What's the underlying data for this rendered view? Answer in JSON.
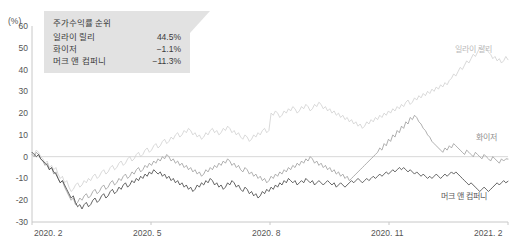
{
  "figure": {
    "clipped_header": "",
    "unit_label": "(%)"
  },
  "callout": {
    "title": "주가수익률 순위",
    "rows": [
      {
        "name": "일라이 릴리",
        "value": "44.5%"
      },
      {
        "name": "화이저",
        "value": "−1.1%"
      },
      {
        "name": "머크 앤 컴퍼니",
        "value": "−11.3%"
      }
    ]
  },
  "series_tags": {
    "lilly": "일라이 릴리",
    "pfizer": "화이저",
    "merck": "머크 앤 컴퍼니"
  },
  "colors": {
    "lilly": "#cfcfcf",
    "pfizer": "#9a9a9a",
    "merck": "#3c3c3c",
    "axis": "#c8c8c8",
    "zero_line": "#d8d8d8",
    "callout_bg": "#e2e2e2"
  },
  "chart_data": {
    "type": "line",
    "title": "주가수익률 순위",
    "xlabel": "",
    "ylabel": "(%)",
    "ylim": [
      -30,
      60
    ],
    "ytick_values": [
      60,
      50,
      40,
      30,
      20,
      10,
      0,
      -10,
      -20,
      -30
    ],
    "ytick_labels": [
      "60",
      "50",
      "40",
      "30",
      "20",
      "10",
      "0",
      "-10",
      "-20",
      "-30"
    ],
    "xtick_labels": [
      "2020. 2",
      "2020. 5",
      "2020. 8",
      "2020. 11",
      "2021. 2"
    ],
    "xtick_positions": [
      0,
      0.25,
      0.5,
      0.75,
      1.0
    ],
    "grid": false,
    "zero_line": true,
    "legend_position": "inline-right",
    "x_range": [
      "2020. 2",
      "2021. 2"
    ],
    "series": [
      {
        "name": "일라이 릴리",
        "color": "#cfcfcf",
        "final_value": 44.5,
        "values": [
          2,
          1,
          3,
          2,
          0,
          -1,
          -3,
          -2,
          -5,
          -4,
          -6,
          -5,
          -8,
          -10,
          -9,
          -12,
          -11,
          -14,
          -16,
          -15,
          -13,
          -12,
          -14,
          -13,
          -11,
          -12,
          -10,
          -11,
          -9,
          -8,
          -10,
          -9,
          -7,
          -6,
          -8,
          -7,
          -5,
          -4,
          -6,
          -5,
          -3,
          -2,
          -4,
          -3,
          -1,
          0,
          -2,
          -1,
          1,
          2,
          0,
          1,
          3,
          4,
          2,
          3,
          5,
          6,
          4,
          5,
          7,
          8,
          6,
          7,
          9,
          8,
          10,
          11,
          9,
          10,
          12,
          11,
          13,
          12,
          10,
          11,
          9,
          10,
          8,
          9,
          11,
          10,
          12,
          13,
          11,
          12,
          10,
          11,
          13,
          12,
          14,
          13,
          11,
          12,
          10,
          11,
          9,
          8,
          10,
          9,
          7,
          8,
          10,
          9,
          11,
          10,
          12,
          13,
          11,
          12,
          20,
          19,
          21,
          20,
          18,
          19,
          21,
          20,
          22,
          21,
          23,
          22,
          20,
          21,
          23,
          22,
          24,
          23,
          21,
          22,
          24,
          23,
          25,
          24,
          22,
          23,
          21,
          22,
          20,
          21,
          19,
          20,
          18,
          19,
          17,
          18,
          16,
          17,
          15,
          16,
          14,
          15,
          13,
          14,
          16,
          15,
          17,
          16,
          18,
          17,
          19,
          18,
          20,
          19,
          21,
          20,
          22,
          21,
          23,
          22,
          24,
          23,
          25,
          26,
          24,
          25,
          27,
          26,
          28,
          27,
          29,
          28,
          30,
          29,
          31,
          30,
          32,
          31,
          33,
          32,
          34,
          33,
          35,
          36,
          38,
          37,
          39,
          41,
          40,
          42,
          44,
          43,
          45,
          47,
          46,
          48,
          50,
          49,
          51,
          50,
          48,
          47,
          45,
          46,
          44,
          45,
          43,
          44,
          46,
          44.5
        ]
      },
      {
        "name": "화이저",
        "color": "#9a9a9a",
        "final_value": -1.1,
        "values": [
          1,
          0,
          2,
          1,
          -1,
          -2,
          -4,
          -3,
          -6,
          -5,
          -8,
          -7,
          -10,
          -12,
          -11,
          -14,
          -16,
          -18,
          -20,
          -19,
          -22,
          -21,
          -19,
          -20,
          -18,
          -17,
          -19,
          -18,
          -16,
          -15,
          -17,
          -16,
          -14,
          -13,
          -15,
          -14,
          -12,
          -11,
          -13,
          -12,
          -10,
          -11,
          -9,
          -8,
          -10,
          -9,
          -7,
          -8,
          -6,
          -5,
          -7,
          -6,
          -4,
          -5,
          -3,
          -4,
          -2,
          -3,
          -1,
          -2,
          0,
          -1,
          1,
          0,
          -2,
          -1,
          -3,
          -2,
          -4,
          -3,
          -5,
          -4,
          -6,
          -5,
          -7,
          -6,
          -8,
          -7,
          -9,
          -8,
          -6,
          -7,
          -5,
          -6,
          -4,
          -5,
          -3,
          -4,
          -2,
          -3,
          -1,
          -2,
          -4,
          -3,
          -5,
          -4,
          -6,
          -7,
          -5,
          -6,
          -8,
          -7,
          -9,
          -8,
          -10,
          -9,
          -11,
          -10,
          -12,
          -11,
          -9,
          -10,
          -8,
          -9,
          -7,
          -8,
          -6,
          -7,
          -5,
          -6,
          -4,
          -5,
          -3,
          -4,
          -2,
          -3,
          -1,
          -2,
          0,
          -1,
          -3,
          -2,
          -4,
          -3,
          -5,
          -4,
          -6,
          -5,
          -7,
          -6,
          -8,
          -7,
          -9,
          -8,
          -10,
          -9,
          -11,
          -10,
          -9,
          -8,
          -7,
          -6,
          -5,
          -4,
          -3,
          -2,
          -1,
          0,
          1,
          2,
          4,
          3,
          6,
          5,
          8,
          7,
          10,
          9,
          12,
          11,
          14,
          13,
          16,
          15,
          18,
          17,
          19,
          18,
          16,
          15,
          13,
          12,
          10,
          9,
          7,
          6,
          5,
          4,
          3,
          2,
          4,
          3,
          5,
          4,
          6,
          5,
          4,
          3,
          2,
          1,
          3,
          2,
          1,
          0,
          2,
          1,
          0,
          -1,
          1,
          0,
          -1,
          -2,
          0,
          -1,
          -2,
          -3,
          -1,
          -2,
          -1,
          -1.1
        ]
      },
      {
        "name": "머크 앤 컴퍼니",
        "color": "#3c3c3c",
        "final_value": -11.3,
        "values": [
          2,
          1,
          0,
          1,
          -1,
          -2,
          -3,
          -4,
          -6,
          -5,
          -7,
          -8,
          -10,
          -12,
          -11,
          -13,
          -15,
          -17,
          -19,
          -18,
          -21,
          -23,
          -22,
          -24,
          -22,
          -21,
          -23,
          -22,
          -20,
          -19,
          -21,
          -20,
          -18,
          -17,
          -19,
          -18,
          -16,
          -15,
          -17,
          -16,
          -14,
          -15,
          -13,
          -12,
          -14,
          -13,
          -11,
          -12,
          -10,
          -11,
          -9,
          -10,
          -8,
          -9,
          -7,
          -8,
          -6,
          -7,
          -8,
          -7,
          -9,
          -8,
          -10,
          -9,
          -11,
          -10,
          -12,
          -11,
          -13,
          -12,
          -14,
          -13,
          -15,
          -14,
          -16,
          -15,
          -13,
          -14,
          -12,
          -13,
          -11,
          -12,
          -10,
          -11,
          -13,
          -12,
          -14,
          -13,
          -15,
          -14,
          -12,
          -13,
          -11,
          -12,
          -14,
          -13,
          -15,
          -16,
          -14,
          -15,
          -17,
          -16,
          -18,
          -17,
          -19,
          -18,
          -16,
          -17,
          -15,
          -16,
          -14,
          -15,
          -13,
          -14,
          -12,
          -13,
          -11,
          -12,
          -10,
          -11,
          -12,
          -11,
          -13,
          -12,
          -11,
          -12,
          -10,
          -11,
          -12,
          -11,
          -13,
          -12,
          -11,
          -12,
          -13,
          -12,
          -11,
          -12,
          -13,
          -12,
          -14,
          -13,
          -12,
          -13,
          -14,
          -13,
          -12,
          -11,
          -12,
          -11,
          -10,
          -11,
          -12,
          -11,
          -10,
          -11,
          -10,
          -9,
          -10,
          -9,
          -8,
          -9,
          -8,
          -7,
          -8,
          -7,
          -6,
          -7,
          -6,
          -5,
          -6,
          -5,
          -6,
          -7,
          -6,
          -7,
          -8,
          -7,
          -8,
          -9,
          -8,
          -9,
          -10,
          -9,
          -10,
          -9,
          -8,
          -9,
          -10,
          -9,
          -8,
          -9,
          -8,
          -7,
          -8,
          -7,
          -8,
          -9,
          -10,
          -11,
          -12,
          -13,
          -12,
          -13,
          -14,
          -15,
          -16,
          -15,
          -14,
          -15,
          -16,
          -15,
          -14,
          -13,
          -12,
          -13,
          -12,
          -11,
          -12,
          -11.3
        ]
      }
    ]
  }
}
